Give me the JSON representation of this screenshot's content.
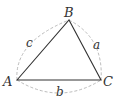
{
  "diagram": {
    "type": "triangle",
    "vertices": [
      {
        "label": "A",
        "x": 17,
        "y": 80
      },
      {
        "label": "B",
        "x": 69,
        "y": 20
      },
      {
        "label": "C",
        "x": 101,
        "y": 80
      }
    ],
    "sides": [
      {
        "label": "c",
        "between": "A-B"
      },
      {
        "label": "a",
        "between": "B-C"
      },
      {
        "label": "b",
        "between": "A-C"
      }
    ],
    "colors": {
      "line": "#333333",
      "dashed": "#aaaaaa"
    }
  }
}
